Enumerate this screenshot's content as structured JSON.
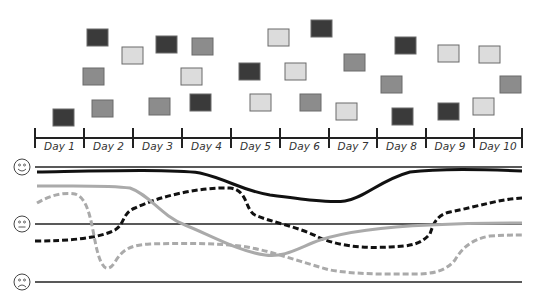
{
  "timeline": {
    "days": [
      "Day 1",
      "Day 2",
      "Day 3",
      "Day 4",
      "Day 5",
      "Day 6",
      "Day 7",
      "Day 8",
      "Day 9",
      "Day 10"
    ],
    "tick_x": [
      35,
      84,
      133,
      182,
      231,
      280,
      329,
      377,
      426,
      474,
      522
    ],
    "axis_y": 138
  },
  "colors": {
    "dark": "#3a3a3a",
    "medium": "#8c8c8c",
    "light": "#dcdcdc",
    "outline": "#6a6a6a",
    "line_dark": "#111111",
    "line_light": "#aaaaaa",
    "reference": "#222222"
  },
  "boxes": [
    {
      "x": 53,
      "y": 109,
      "shade": "dark"
    },
    {
      "x": 87,
      "y": 29,
      "shade": "dark"
    },
    {
      "x": 122,
      "y": 47,
      "shade": "light"
    },
    {
      "x": 83,
      "y": 68,
      "shade": "medium"
    },
    {
      "x": 92,
      "y": 100,
      "shade": "medium"
    },
    {
      "x": 156,
      "y": 36,
      "shade": "dark"
    },
    {
      "x": 149,
      "y": 98,
      "shade": "medium"
    },
    {
      "x": 192,
      "y": 38,
      "shade": "medium"
    },
    {
      "x": 181,
      "y": 68,
      "shade": "light"
    },
    {
      "x": 190,
      "y": 94,
      "shade": "dark"
    },
    {
      "x": 239,
      "y": 63,
      "shade": "dark"
    },
    {
      "x": 250,
      "y": 94,
      "shade": "light"
    },
    {
      "x": 268,
      "y": 29,
      "shade": "light"
    },
    {
      "x": 311,
      "y": 20,
      "shade": "dark"
    },
    {
      "x": 285,
      "y": 63,
      "shade": "light"
    },
    {
      "x": 300,
      "y": 94,
      "shade": "medium"
    },
    {
      "x": 344,
      "y": 54,
      "shade": "medium"
    },
    {
      "x": 336,
      "y": 103,
      "shade": "light"
    },
    {
      "x": 395,
      "y": 37,
      "shade": "dark"
    },
    {
      "x": 381,
      "y": 76,
      "shade": "medium"
    },
    {
      "x": 392,
      "y": 108,
      "shade": "dark"
    },
    {
      "x": 438,
      "y": 45,
      "shade": "light"
    },
    {
      "x": 438,
      "y": 103,
      "shade": "dark"
    },
    {
      "x": 479,
      "y": 46,
      "shade": "light"
    },
    {
      "x": 500,
      "y": 76,
      "shade": "medium"
    },
    {
      "x": 473,
      "y": 98,
      "shade": "light"
    }
  ],
  "mood_levels": [
    {
      "name": "happy",
      "y": 167,
      "face": "smile"
    },
    {
      "name": "neutral",
      "y": 224,
      "face": "flat"
    },
    {
      "name": "sad",
      "y": 282,
      "face": "frown"
    }
  ],
  "mood_lines": [
    {
      "name": "series-solid-dark",
      "style": "solid",
      "color": "line_dark",
      "d": "M37,172 C100,171 170,169 200,173 C230,180 240,190 270,195 C300,199 330,203 345,201 C365,198 380,180 410,172 C440,168 480,169 522,171"
    },
    {
      "name": "series-dashed-dark",
      "style": "dashed",
      "color": "line_dark",
      "d": "M35,241 C70,241 100,238 115,230 C125,224 122,213 135,208 C160,196 200,187 230,188 C248,190 245,210 255,215 C270,222 300,227 320,238 C345,248 370,248 390,247 C410,246 420,245 430,234 C433,225 436,215 450,212 C480,206 500,199 522,198"
    },
    {
      "name": "series-solid-light",
      "style": "solid",
      "color": "line_light",
      "d": "M37,186 C80,186 110,185 130,188 C150,195 160,215 185,225 C210,235 240,252 265,255 C285,258 300,247 320,240 C345,232 380,227 430,225 C470,223 500,223 522,223"
    },
    {
      "name": "series-dashed-light",
      "style": "dashed",
      "color": "line_light",
      "d": "M37,203 C50,195 65,192 75,194 C90,198 92,230 97,250 C102,270 108,273 115,262 C122,250 130,245 150,244 C180,243 210,243 240,246 C270,250 300,262 330,270 C360,275 390,274 420,274 C440,273 448,268 455,260 C462,248 472,239 490,236 C505,235 515,235 522,235"
    }
  ],
  "chart_data": {
    "type": "line",
    "title": "",
    "xlabel": "",
    "ylabel": "",
    "categories": [
      "Day 1",
      "Day 2",
      "Day 3",
      "Day 4",
      "Day 5",
      "Day 6",
      "Day 7",
      "Day 8",
      "Day 9",
      "Day 10"
    ],
    "y_levels": [
      "sad",
      "neutral",
      "happy"
    ],
    "ylim": [
      -1,
      1
    ],
    "grid": true,
    "series": [
      {
        "name": "solid dark",
        "values": [
          0.92,
          0.92,
          0.92,
          0.92,
          0.6,
          0.5,
          0.45,
          0.9,
          0.92,
          0.9
        ]
      },
      {
        "name": "dashed dark",
        "values": [
          -0.3,
          -0.25,
          0.3,
          0.55,
          0.5,
          -0.1,
          -0.35,
          -0.4,
          0.25,
          0.45
        ]
      },
      {
        "name": "solid light",
        "values": [
          0.65,
          0.65,
          0.55,
          0.1,
          -0.45,
          -0.45,
          -0.1,
          -0.02,
          0.02,
          0.02
        ]
      },
      {
        "name": "dashed light",
        "values": [
          0.35,
          0.45,
          -0.35,
          -0.35,
          -0.4,
          -0.7,
          -0.85,
          -0.85,
          -0.2,
          -0.2
        ]
      }
    ],
    "annotations": [
      "scatter of dark/medium/light boxes above each day"
    ]
  }
}
